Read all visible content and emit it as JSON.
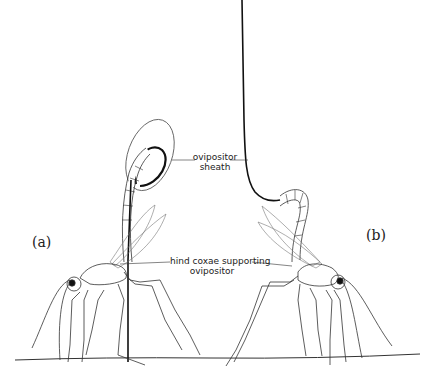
{
  "figure": {
    "panels": [
      {
        "id": "a",
        "label": "(a)"
      },
      {
        "id": "b",
        "label": "(b)"
      }
    ],
    "annotations": {
      "ovipositor_sheath": {
        "line1": "ovipositor",
        "line2": "sheath"
      },
      "hind_coxae": {
        "line1": "hind coxae supporting",
        "line2": "ovipositor"
      }
    },
    "colors": {
      "ink": "#1a1a1a",
      "light_ink": "#6b6b6b",
      "background": "#ffffff"
    }
  }
}
